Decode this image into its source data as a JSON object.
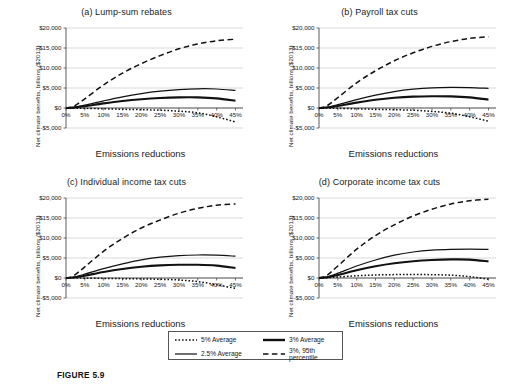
{
  "figure": {
    "caption": "FIGURE 5.9",
    "axis_x_label": "Emissions reductions",
    "axis_y_label": "Net climate benefits, billions ($2013)"
  },
  "legend": {
    "items": [
      {
        "label": "5% Average",
        "style": "dotted",
        "icon": "dotted-line-icon"
      },
      {
        "label": "3% Average",
        "style": "thick-solid",
        "icon": "thick-solid-line-icon"
      },
      {
        "label": "2.5% Average",
        "style": "thin-solid",
        "icon": "thin-solid-line-icon"
      },
      {
        "label": "3%, 95th percentile",
        "style": "dashed",
        "icon": "dashed-line-icon"
      }
    ]
  },
  "axes": {
    "y_ticks": [
      "$20,000",
      "$15,000",
      "$10,000",
      "$5,000",
      "$0",
      "-$5,000"
    ],
    "y_tick_values": [
      20000,
      15000,
      10000,
      5000,
      0,
      -5000
    ],
    "x_ticks": [
      "0%",
      "5%",
      "10%",
      "15%",
      "20%",
      "25%",
      "30%",
      "35%",
      "40%",
      "45%"
    ],
    "x_tick_values": [
      0,
      5,
      10,
      15,
      20,
      25,
      30,
      35,
      40,
      45
    ]
  },
  "panels": [
    {
      "key": "a",
      "title": "(a) Lump-sum rebates"
    },
    {
      "key": "b",
      "title": "(b) Payroll tax cuts"
    },
    {
      "key": "c",
      "title": "(c) Individual income tax cuts"
    },
    {
      "key": "d",
      "title": "(d) Corporate income tax cuts"
    }
  ],
  "chart_data": [
    {
      "type": "line",
      "panel": "a",
      "title": "(a) Lump-sum rebates",
      "xlabel": "Emissions reductions",
      "ylabel": "Net climate benefits, billions ($2013)",
      "xlim": [
        0,
        47
      ],
      "ylim": [
        -5000,
        20000
      ],
      "grid": true,
      "legend_position": "below-figure",
      "x": [
        0,
        2,
        5,
        10,
        15,
        20,
        25,
        30,
        35,
        40,
        45
      ],
      "series": [
        {
          "name": "3%, 95th percentile",
          "style": "dashed",
          "values": [
            0,
            400,
            2300,
            5800,
            8700,
            11100,
            13100,
            14800,
            16000,
            16800,
            17200
          ]
        },
        {
          "name": "2.5% Average",
          "style": "thin-solid",
          "values": [
            0,
            150,
            700,
            1800,
            2800,
            3600,
            4200,
            4600,
            4800,
            4750,
            4400
          ]
        },
        {
          "name": "3% Average",
          "style": "thick-solid",
          "values": [
            0,
            100,
            450,
            1150,
            1750,
            2200,
            2500,
            2650,
            2650,
            2400,
            1800
          ]
        },
        {
          "name": "5% Average",
          "style": "dotted",
          "values": [
            0,
            -20,
            -80,
            -200,
            -320,
            -420,
            -550,
            -800,
            -1200,
            -2200,
            -3500
          ]
        }
      ]
    },
    {
      "type": "line",
      "panel": "b",
      "title": "(b) Payroll tax cuts",
      "xlabel": "Emissions reductions",
      "ylabel": "Net climate benefits, billions ($2013)",
      "xlim": [
        0,
        47
      ],
      "ylim": [
        -5000,
        20000
      ],
      "grid": true,
      "legend_position": "below-figure",
      "x": [
        0,
        2,
        5,
        10,
        15,
        20,
        25,
        30,
        35,
        40,
        45
      ],
      "series": [
        {
          "name": "3%, 95th percentile",
          "style": "dashed",
          "values": [
            0,
            500,
            2600,
            6300,
            9300,
            11800,
            13800,
            15400,
            16600,
            17400,
            17800
          ]
        },
        {
          "name": "2.5% Average",
          "style": "thin-solid",
          "values": [
            0,
            180,
            850,
            2100,
            3200,
            4100,
            4700,
            5050,
            5150,
            5100,
            4900
          ]
        },
        {
          "name": "3% Average",
          "style": "thick-solid",
          "values": [
            0,
            120,
            520,
            1350,
            2050,
            2550,
            2850,
            2950,
            2900,
            2650,
            2100
          ]
        },
        {
          "name": "5% Average",
          "style": "dotted",
          "values": [
            0,
            -20,
            -80,
            -200,
            -320,
            -420,
            -560,
            -850,
            -1300,
            -2200,
            -3300
          ]
        }
      ]
    },
    {
      "type": "line",
      "panel": "c",
      "title": "(c) Individual income tax cuts",
      "xlabel": "Emissions reductions",
      "ylabel": "Net climate benefits, billions ($2013)",
      "xlim": [
        0,
        47
      ],
      "ylim": [
        -5000,
        20000
      ],
      "grid": true,
      "legend_position": "below-figure",
      "x": [
        0,
        2,
        5,
        10,
        15,
        20,
        25,
        30,
        35,
        40,
        45
      ],
      "series": [
        {
          "name": "3%, 95th percentile",
          "style": "dashed",
          "values": [
            0,
            550,
            2800,
            6700,
            9900,
            12500,
            14500,
            16200,
            17400,
            18200,
            18500
          ]
        },
        {
          "name": "2.5% Average",
          "style": "thin-solid",
          "values": [
            0,
            200,
            950,
            2350,
            3550,
            4550,
            5200,
            5600,
            5750,
            5700,
            5450
          ]
        },
        {
          "name": "3% Average",
          "style": "thick-solid",
          "values": [
            0,
            130,
            580,
            1500,
            2250,
            2800,
            3150,
            3300,
            3300,
            3100,
            2500
          ]
        },
        {
          "name": "5% Average",
          "style": "dotted",
          "values": [
            0,
            -10,
            -40,
            -100,
            -160,
            -220,
            -320,
            -500,
            -900,
            -1700,
            -2600
          ]
        }
      ]
    },
    {
      "type": "line",
      "panel": "d",
      "title": "(d) Corporate income tax cuts",
      "xlabel": "Emissions reductions",
      "ylabel": "Net climate benefits, billions ($2013)",
      "xlim": [
        0,
        47
      ],
      "ylim": [
        -5000,
        20000
      ],
      "grid": true,
      "legend_position": "below-figure",
      "x": [
        0,
        2,
        5,
        10,
        15,
        20,
        25,
        30,
        35,
        40,
        45
      ],
      "series": [
        {
          "name": "3%, 95th percentile",
          "style": "dashed",
          "values": [
            0,
            600,
            3000,
            7200,
            10600,
            13300,
            15500,
            17200,
            18500,
            19300,
            19700
          ]
        },
        {
          "name": "2.5% Average",
          "style": "thin-solid",
          "values": [
            0,
            250,
            1200,
            3000,
            4500,
            5700,
            6500,
            6950,
            7150,
            7200,
            7150
          ]
        },
        {
          "name": "3% Average",
          "style": "thick-solid",
          "values": [
            0,
            160,
            750,
            1950,
            2950,
            3700,
            4200,
            4500,
            4650,
            4600,
            4150
          ]
        },
        {
          "name": "5% Average",
          "style": "dotted",
          "values": [
            0,
            60,
            250,
            560,
            750,
            850,
            880,
            830,
            700,
            350,
            -300
          ]
        }
      ]
    }
  ]
}
